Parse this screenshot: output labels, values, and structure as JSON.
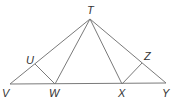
{
  "diagram": {
    "points": {
      "T": {
        "label": "T",
        "x": 90,
        "y": 19,
        "lx": 87,
        "ly": 14
      },
      "U": {
        "label": "U",
        "x": 35,
        "y": 64,
        "lx": 26,
        "ly": 64
      },
      "V": {
        "label": "V",
        "x": 10,
        "y": 84,
        "lx": 2,
        "ly": 97
      },
      "W": {
        "label": "W",
        "x": 55,
        "y": 84,
        "lx": 49,
        "ly": 97
      },
      "X": {
        "label": "X",
        "x": 122,
        "y": 84,
        "lx": 118,
        "ly": 97
      },
      "Y": {
        "label": "Y",
        "x": 166,
        "y": 83,
        "lx": 162,
        "ly": 97
      },
      "Z": {
        "label": "Z",
        "x": 142,
        "y": 63,
        "lx": 144,
        "ly": 60
      }
    },
    "segments": [
      [
        "V",
        "T"
      ],
      [
        "T",
        "Y"
      ],
      [
        "V",
        "Y"
      ],
      [
        "T",
        "W"
      ],
      [
        "T",
        "X"
      ],
      [
        "U",
        "W"
      ],
      [
        "Z",
        "X"
      ]
    ],
    "line_color": "#7a7a7a"
  }
}
